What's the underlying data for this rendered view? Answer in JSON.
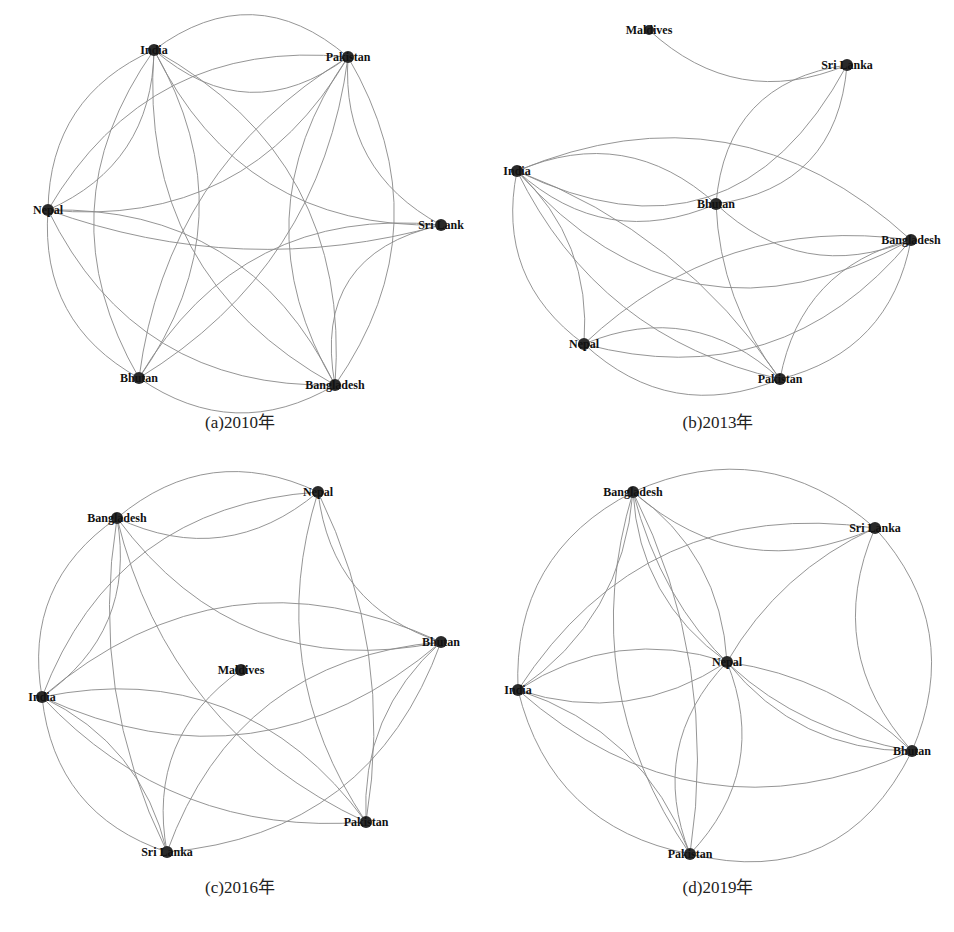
{
  "figure": {
    "panels": [
      {
        "id": "a",
        "caption": "(a)2010年",
        "caption_pos": [
          240,
          428
        ],
        "nodes": [
          {
            "name": "India",
            "x": 154,
            "y": 50,
            "r": 6
          },
          {
            "name": "Pakistan",
            "x": 348,
            "y": 57,
            "r": 6
          },
          {
            "name": "Nepal",
            "x": 48,
            "y": 210,
            "r": 6
          },
          {
            "name": "Sri Lank",
            "x": 441,
            "y": 225,
            "r": 6
          },
          {
            "name": "Bhutan",
            "x": 139,
            "y": 378,
            "r": 6
          },
          {
            "name": "Bangladesh",
            "x": 335,
            "y": 385,
            "r": 6
          }
        ],
        "edges": [
          [
            "India",
            "Pakistan",
            0.25
          ],
          [
            "Pakistan",
            "India",
            0.25
          ],
          [
            "India",
            "Nepal",
            0.2
          ],
          [
            "Nepal",
            "India",
            0.2
          ],
          [
            "India",
            "Sri Lank",
            0.2
          ],
          [
            "India",
            "Bhutan",
            0.2
          ],
          [
            "Bhutan",
            "India",
            0.2
          ],
          [
            "India",
            "Bangladesh",
            0.2
          ],
          [
            "Bangladesh",
            "India",
            0.2
          ],
          [
            "Pakistan",
            "Nepal",
            0.2
          ],
          [
            "Nepal",
            "Pakistan",
            0.2
          ],
          [
            "Pakistan",
            "Sri Lank",
            0.2
          ],
          [
            "Pakistan",
            "Bhutan",
            0.15
          ],
          [
            "Bhutan",
            "Pakistan",
            0.15
          ],
          [
            "Pakistan",
            "Bangladesh",
            0.2
          ],
          [
            "Bangladesh",
            "Pakistan",
            0.2
          ],
          [
            "Nepal",
            "Sri Lank",
            0.1
          ],
          [
            "Nepal",
            "Bhutan",
            0.2
          ],
          [
            "Nepal",
            "Bangladesh",
            0.2
          ],
          [
            "Bangladesh",
            "Nepal",
            0.2
          ],
          [
            "Sri Lank",
            "Bhutan",
            0.2
          ],
          [
            "Sri Lank",
            "Bangladesh",
            0.3
          ],
          [
            "Bhutan",
            "Bangladesh",
            0.2
          ]
        ]
      },
      {
        "id": "b",
        "caption": "(b)2013年",
        "caption_pos": [
          718,
          428
        ],
        "nodes": [
          {
            "name": "Maldives",
            "x": 649,
            "y": 30,
            "r": 5
          },
          {
            "name": "Sri Lanka",
            "x": 847,
            "y": 65,
            "r": 6
          },
          {
            "name": "India",
            "x": 517,
            "y": 171,
            "r": 6
          },
          {
            "name": "Bhutan",
            "x": 716,
            "y": 204,
            "r": 6
          },
          {
            "name": "Bangladesh",
            "x": 911,
            "y": 240,
            "r": 6
          },
          {
            "name": "Nepal",
            "x": 584,
            "y": 344,
            "r": 6
          },
          {
            "name": "Pakistan",
            "x": 780,
            "y": 379,
            "r": 6
          }
        ],
        "edges": [
          [
            "Maldives",
            "Sri Lanka",
            0.2
          ],
          [
            "India",
            "Sri Lanka",
            0.3
          ],
          [
            "Sri Lanka",
            "Bhutan",
            0.25
          ],
          [
            "Bhutan",
            "Sri Lanka",
            0.25
          ],
          [
            "India",
            "Bhutan",
            0.2
          ],
          [
            "Bhutan",
            "India",
            0.2
          ],
          [
            "India",
            "Bangladesh",
            0.25
          ],
          [
            "Bangladesh",
            "India",
            0.2
          ],
          [
            "India",
            "Nepal",
            0.2
          ],
          [
            "Nepal",
            "India",
            0.15
          ],
          [
            "India",
            "Pakistan",
            0.15
          ],
          [
            "Pakistan",
            "India",
            0.1
          ],
          [
            "Bhutan",
            "Bangladesh",
            0.2
          ],
          [
            "Bhutan",
            "Pakistan",
            0.1
          ],
          [
            "Nepal",
            "Bangladesh",
            0.2
          ],
          [
            "Bangladesh",
            "Nepal",
            0.15
          ],
          [
            "Nepal",
            "Pakistan",
            0.2
          ],
          [
            "Pakistan",
            "Nepal",
            0.2
          ],
          [
            "Pakistan",
            "Bangladesh",
            0.2
          ],
          [
            "Bangladesh",
            "Pakistan",
            0.2
          ]
        ]
      },
      {
        "id": "c",
        "caption": "(c)2016年",
        "caption_pos": [
          240,
          893
        ],
        "nodes": [
          {
            "name": "Nepal",
            "x": 318,
            "y": 492,
            "r": 6
          },
          {
            "name": "Bangladesh",
            "x": 117,
            "y": 518,
            "r": 6
          },
          {
            "name": "Bhutan",
            "x": 441,
            "y": 642,
            "r": 6
          },
          {
            "name": "Maldives",
            "x": 241,
            "y": 670,
            "r": 6
          },
          {
            "name": "India",
            "x": 42,
            "y": 697,
            "r": 6
          },
          {
            "name": "Pakistan",
            "x": 366,
            "y": 822,
            "r": 6
          },
          {
            "name": "Sri Lanka",
            "x": 167,
            "y": 852,
            "r": 6
          }
        ],
        "edges": [
          [
            "Bangladesh",
            "Nepal",
            0.2
          ],
          [
            "Nepal",
            "Bangladesh",
            0.2
          ],
          [
            "Bangladesh",
            "Bhutan",
            0.2
          ],
          [
            "Bangladesh",
            "Pakistan",
            0.15
          ],
          [
            "Bangladesh",
            "India",
            0.2
          ],
          [
            "India",
            "Bangladesh",
            0.2
          ],
          [
            "Bangladesh",
            "Sri Lanka",
            0.1
          ],
          [
            "Nepal",
            "India",
            0.2
          ],
          [
            "Nepal",
            "Pakistan",
            0.15
          ],
          [
            "Pakistan",
            "Nepal",
            0.1
          ],
          [
            "Nepal",
            "Bhutan",
            0.2
          ],
          [
            "India",
            "Bhutan",
            0.2
          ],
          [
            "Bhutan",
            "India",
            0.2
          ],
          [
            "India",
            "Pakistan",
            0.15
          ],
          [
            "Pakistan",
            "India",
            0.2
          ],
          [
            "India",
            "Sri Lanka",
            0.2
          ],
          [
            "Sri Lanka",
            "India",
            0.15
          ],
          [
            "Bhutan",
            "Sri Lanka",
            0.2
          ],
          [
            "Sri Lanka",
            "Bhutan",
            0.2
          ],
          [
            "Bhutan",
            "Pakistan",
            0.15
          ],
          [
            "Maldives",
            "Sri Lanka",
            0.2
          ]
        ]
      },
      {
        "id": "d",
        "caption": "(d)2019年",
        "caption_pos": [
          718,
          893
        ],
        "nodes": [
          {
            "name": "Bangladesh",
            "x": 633,
            "y": 492,
            "r": 6
          },
          {
            "name": "Sri Lanka",
            "x": 875,
            "y": 528,
            "r": 6
          },
          {
            "name": "Nepal",
            "x": 727,
            "y": 662,
            "r": 6
          },
          {
            "name": "India",
            "x": 518,
            "y": 690,
            "r": 6
          },
          {
            "name": "Bhutan",
            "x": 912,
            "y": 751,
            "r": 6
          },
          {
            "name": "Pakistan",
            "x": 690,
            "y": 854,
            "r": 6
          }
        ],
        "edges": [
          [
            "Bangladesh",
            "Sri Lanka",
            0.2
          ],
          [
            "Sri Lanka",
            "Bangladesh",
            0.2
          ],
          [
            "Bangladesh",
            "Nepal",
            0.15
          ],
          [
            "Nepal",
            "Bangladesh",
            0.15
          ],
          [
            "Bangladesh",
            "India",
            0.2
          ],
          [
            "India",
            "Bangladesh",
            0.15
          ],
          [
            "Bangladesh",
            "Bhutan",
            0.2
          ],
          [
            "Bangladesh",
            "Pakistan",
            0.15
          ],
          [
            "Pakistan",
            "Bangladesh",
            0.1
          ],
          [
            "Sri Lanka",
            "India",
            0.2
          ],
          [
            "Sri Lanka",
            "Nepal",
            0.1
          ],
          [
            "Sri Lanka",
            "Bhutan",
            0.2
          ],
          [
            "Bhutan",
            "Sri Lanka",
            0.2
          ],
          [
            "Nepal",
            "India",
            0.15
          ],
          [
            "India",
            "Nepal",
            0.15
          ],
          [
            "Nepal",
            "Bhutan",
            0.15
          ],
          [
            "Bhutan",
            "Nepal",
            0.1
          ],
          [
            "Nepal",
            "Pakistan",
            0.2
          ],
          [
            "Pakistan",
            "Nepal",
            0.2
          ],
          [
            "India",
            "Bhutan",
            0.2
          ],
          [
            "India",
            "Pakistan",
            0.2
          ],
          [
            "Pakistan",
            "India",
            0.15
          ],
          [
            "Pakistan",
            "Bhutan",
            0.25
          ]
        ]
      }
    ]
  }
}
